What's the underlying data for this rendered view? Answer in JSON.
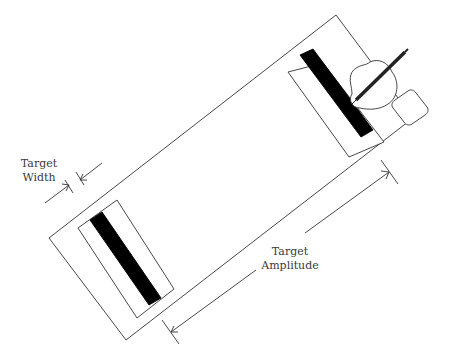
{
  "diagram": {
    "labels": {
      "target_width": [
        "Target",
        "Width"
      ],
      "target_amplitude": [
        "Target",
        "Amplitude"
      ]
    },
    "colors": {
      "stroke": "#333333",
      "target_bar": "#000000",
      "background": "#ffffff"
    },
    "elements": [
      {
        "id": "outer-board",
        "type": "rectangle"
      },
      {
        "id": "left-target",
        "type": "target",
        "bar_color": "#000000"
      },
      {
        "id": "right-target",
        "type": "target",
        "bar_color": "#000000"
      },
      {
        "id": "hand-with-pen",
        "type": "illustration"
      },
      {
        "id": "width-arrows",
        "type": "dimension",
        "label": "Target Width"
      },
      {
        "id": "amplitude-arrows",
        "type": "dimension",
        "label": "Target Amplitude"
      }
    ]
  }
}
